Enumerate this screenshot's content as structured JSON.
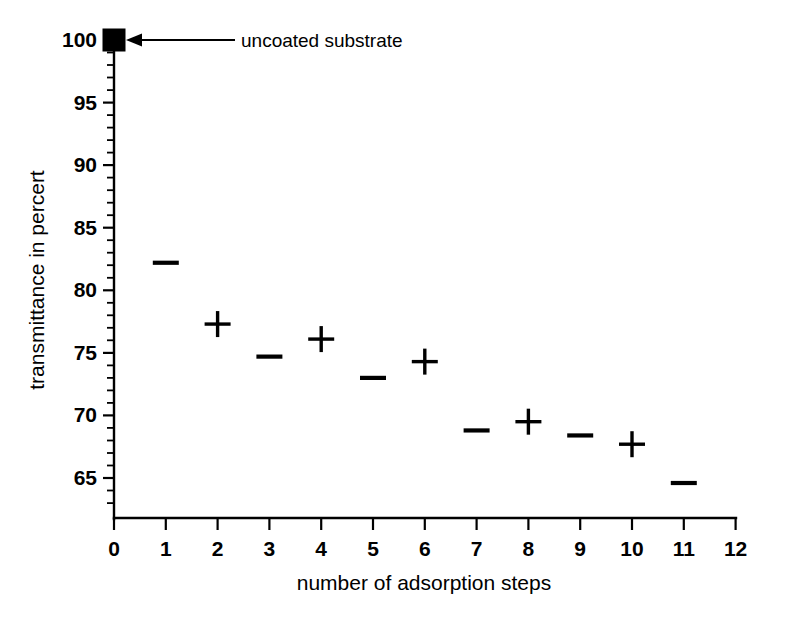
{
  "figure": {
    "width": 788,
    "height": 622,
    "background_color": "#ffffff",
    "ink_color": "#000000"
  },
  "chart_data": {
    "type": "scatter",
    "title": "",
    "xlabel": "number of adsorption steps",
    "ylabel": "transmittance in percert",
    "xlim": [
      0,
      12
    ],
    "ylim": [
      63,
      101.5
    ],
    "grid": false,
    "legend_position": "none",
    "x_ticks": [
      "0",
      "1",
      "2",
      "3",
      "4",
      "5",
      "6",
      "7",
      "8",
      "9",
      "10",
      "11",
      "12"
    ],
    "x_tick_values": [
      0,
      1,
      2,
      3,
      4,
      5,
      6,
      7,
      8,
      9,
      10,
      11,
      12
    ],
    "y_ticks": [
      "65",
      "70",
      "75",
      "80",
      "85",
      "90",
      "95",
      "100"
    ],
    "y_tick_values": [
      65,
      70,
      75,
      80,
      85,
      90,
      95,
      100
    ],
    "y_minor_step": 1,
    "x": [
      0,
      1,
      2,
      3,
      4,
      5,
      6,
      7,
      8,
      9,
      10,
      11
    ],
    "values": [
      100.0,
      82.2,
      77.3,
      74.7,
      76.1,
      73.0,
      74.3,
      68.8,
      69.5,
      68.4,
      67.7,
      64.6
    ],
    "markers": [
      "square",
      "dash",
      "plus",
      "dash",
      "plus",
      "dash",
      "plus",
      "dash",
      "plus",
      "dash",
      "plus",
      "dash"
    ],
    "series": [
      {
        "name": "transmittance",
        "x": [
          0,
          1,
          2,
          3,
          4,
          5,
          6,
          7,
          8,
          9,
          10,
          11
        ],
        "values": [
          100.0,
          82.2,
          77.3,
          74.7,
          76.1,
          73.0,
          74.3,
          68.8,
          69.5,
          68.4,
          67.7,
          64.6
        ]
      }
    ],
    "annotations": [
      {
        "text": "uncoated substrate",
        "points_to_x": 0,
        "points_to_y": 100,
        "arrow": "left"
      }
    ]
  },
  "axes": {
    "x_axis_title": "number of adsorption steps",
    "y_axis_title": "transmittance in percert"
  },
  "annotation": {
    "uncoated_substrate_label": "uncoated substrate"
  },
  "x_tick_labels": {
    "t0": "0",
    "t1": "1",
    "t2": "2",
    "t3": "3",
    "t4": "4",
    "t5": "5",
    "t6": "6",
    "t7": "7",
    "t8": "8",
    "t9": "9",
    "t10": "10",
    "t11": "11",
    "t12": "12"
  },
  "y_tick_labels": {
    "v65": "65",
    "v70": "70",
    "v75": "75",
    "v80": "80",
    "v85": "85",
    "v90": "90",
    "v95": "95",
    "v100": "100"
  }
}
